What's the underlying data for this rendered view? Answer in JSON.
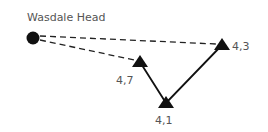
{
  "diagram": {
    "start": {
      "label": "Wasdale Head",
      "x": 33,
      "y": 38
    },
    "points": [
      {
        "label": "4,7",
        "x": 140,
        "y": 62
      },
      {
        "label": "4,1",
        "x": 166,
        "y": 103
      },
      {
        "label": "4,3",
        "x": 222,
        "y": 45
      }
    ],
    "colors": {
      "ink": "#111111",
      "text": "#555555",
      "background": "#ffffff"
    }
  }
}
